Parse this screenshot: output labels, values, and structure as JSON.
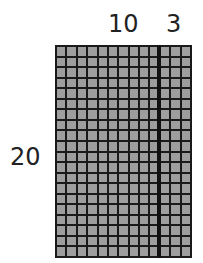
{
  "labels": {
    "top_left": "10",
    "top_right": "3",
    "left": "20"
  },
  "grid": {
    "columns": 13,
    "rows": 20,
    "divider_after_column": 10,
    "cell_color": "#9e9e9e",
    "line_color": "#1a1a1a"
  }
}
